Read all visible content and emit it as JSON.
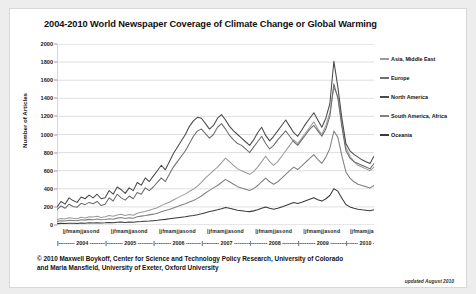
{
  "chart_data": {
    "type": "line",
    "title": "2004-2010 World Newspaper Coverage of Climate Change or Global Warming",
    "xlabel": "",
    "ylabel": "Number of Articles",
    "ylim": [
      0,
      2000
    ],
    "ytick_step": 200,
    "yticks": [
      "2000",
      "1800",
      "1600",
      "1400",
      "1200",
      "1000",
      "800",
      "600",
      "400",
      "200",
      "0"
    ],
    "grid": true,
    "legend_position": "right",
    "months": [
      "j",
      "f",
      "m",
      "a",
      "m",
      "j",
      "j",
      "a",
      "s",
      "o",
      "n",
      "d"
    ],
    "years": [
      "2004",
      "2005",
      "2006",
      "2007",
      "2008",
      "2009",
      "2010"
    ],
    "x_start": "2004-01",
    "x_end": "2010-08",
    "n_points": 80,
    "series": [
      {
        "name": "Asia, Middle East",
        "color": "#9a9a9a",
        "values": [
          60,
          72,
          66,
          80,
          74,
          70,
          86,
          78,
          92,
          88,
          96,
          84,
          90,
          104,
          96,
          110,
          118,
          104,
          116,
          108,
          130,
          142,
          150,
          162,
          176,
          190,
          214,
          236,
          252,
          276,
          300,
          322,
          344,
          372,
          396,
          430,
          470,
          520,
          560,
          600,
          640,
          690,
          740,
          700,
          660,
          620,
          600,
          580,
          560,
          590,
          640,
          700,
          760,
          700,
          660,
          700,
          760,
          820,
          880,
          940,
          900,
          960,
          1020,
          1080,
          1140,
          1060,
          1000,
          1100,
          1240,
          1520,
          1420,
          1120,
          860,
          760,
          700,
          660,
          640,
          620,
          600,
          640
        ]
      },
      {
        "name": "Europe",
        "color": "#6e6e6e",
        "values": [
          170,
          210,
          185,
          230,
          205,
          195,
          240,
          225,
          250,
          235,
          260,
          215,
          230,
          300,
          265,
          340,
          300,
          275,
          320,
          290,
          360,
          340,
          410,
          380,
          420,
          470,
          520,
          480,
          560,
          640,
          700,
          760,
          820,
          900,
          980,
          1040,
          1060,
          1010,
          960,
          1000,
          1080,
          1120,
          1060,
          990,
          940,
          900,
          880,
          840,
          800,
          860,
          920,
          980,
          900,
          840,
          880,
          940,
          990,
          1040,
          980,
          920,
          880,
          940,
          1000,
          1060,
          1100,
          1040,
          980,
          1060,
          1200,
          1560,
          1400,
          1080,
          820,
          740,
          700,
          680,
          660,
          640,
          620,
          680
        ]
      },
      {
        "name": "North America",
        "color": "#4a4a4a",
        "values": [
          200,
          260,
          230,
          300,
          270,
          250,
          310,
          290,
          330,
          300,
          340,
          290,
          300,
          380,
          340,
          420,
          390,
          350,
          410,
          380,
          470,
          440,
          520,
          480,
          540,
          600,
          660,
          610,
          700,
          790,
          860,
          930,
          1000,
          1090,
          1150,
          1190,
          1180,
          1120,
          1060,
          1100,
          1180,
          1220,
          1160,
          1090,
          1040,
          1000,
          960,
          920,
          880,
          940,
          1020,
          1080,
          990,
          930,
          980,
          1040,
          1100,
          1160,
          1090,
          1020,
          980,
          1050,
          1120,
          1180,
          1240,
          1160,
          1080,
          1180,
          1340,
          1810,
          1520,
          1180,
          900,
          820,
          780,
          750,
          720,
          700,
          680,
          760
        ]
      },
      {
        "name": "South America, Africa",
        "color": "#808080",
        "values": [
          40,
          48,
          44,
          52,
          50,
          46,
          58,
          54,
          62,
          58,
          66,
          58,
          60,
          70,
          64,
          76,
          82,
          72,
          80,
          74,
          90,
          98,
          104,
          112,
          120,
          130,
          146,
          160,
          172,
          188,
          204,
          220,
          236,
          254,
          270,
          294,
          320,
          354,
          382,
          410,
          436,
          470,
          504,
          478,
          450,
          424,
          410,
          396,
          382,
          402,
          436,
          478,
          518,
          478,
          450,
          478,
          518,
          560,
          600,
          640,
          614,
          654,
          696,
          736,
          778,
          724,
          682,
          750,
          846,
          1038,
          968,
          764,
          586,
          518,
          478,
          450,
          436,
          424,
          410,
          436
        ]
      },
      {
        "name": "Oceania",
        "color": "#3a3a3a",
        "values": [
          15,
          18,
          16,
          20,
          19,
          17,
          22,
          20,
          24,
          22,
          26,
          22,
          24,
          28,
          26,
          30,
          32,
          28,
          32,
          30,
          36,
          38,
          42,
          44,
          48,
          52,
          58,
          62,
          68,
          74,
          80,
          86,
          92,
          100,
          106,
          114,
          124,
          136,
          148,
          158,
          168,
          180,
          194,
          184,
          174,
          164,
          158,
          152,
          148,
          156,
          168,
          184,
          200,
          184,
          174,
          184,
          200,
          216,
          232,
          248,
          238,
          252,
          268,
          284,
          300,
          280,
          264,
          290,
          326,
          400,
          374,
          296,
          226,
          200,
          184,
          174,
          168,
          164,
          158,
          168
        ]
      }
    ]
  },
  "legend": {
    "items": [
      {
        "label": "Asia, Middle East"
      },
      {
        "label": "Europe"
      },
      {
        "label": "North America"
      },
      {
        "label": "South America, Africa"
      },
      {
        "label": "Oceania"
      }
    ]
  },
  "footer": {
    "credit_line1": "© 2010 Maxwell Boykoff, Center for Science and Technology Policy Research, University of Colorado",
    "credit_line2": "and Maria Mansfield, University of Exeter, Oxford University",
    "updated": "updated August 2010"
  },
  "colors": {
    "background": "#ededed",
    "panel": "#ffffff",
    "grid": "#c9c9c9",
    "text": "#111111"
  }
}
